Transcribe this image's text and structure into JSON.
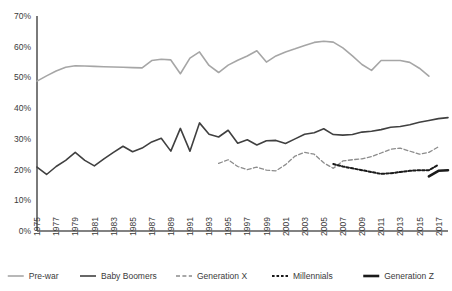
{
  "chart_data": {
    "type": "line",
    "title": "",
    "xlabel": "",
    "ylabel": "",
    "ylim": [
      0,
      70
    ],
    "yticks": [
      "0%",
      "10%",
      "20%",
      "30%",
      "40%",
      "50%",
      "60%",
      "70%"
    ],
    "ytick_values": [
      0,
      10,
      20,
      30,
      40,
      50,
      60,
      70
    ],
    "grid": false,
    "legend_position": "bottom",
    "x": [
      1975,
      1976,
      1977,
      1978,
      1979,
      1980,
      1981,
      1982,
      1983,
      1984,
      1985,
      1986,
      1987,
      1988,
      1989,
      1990,
      1991,
      1992,
      1993,
      1994,
      1995,
      1996,
      1997,
      1998,
      1999,
      2000,
      2001,
      2002,
      2003,
      2004,
      2005,
      2006,
      2007,
      2008,
      2009,
      2010,
      2011,
      2012,
      2013,
      2014,
      2015,
      2016,
      2017,
      2018
    ],
    "xticks": [
      "1975",
      "1977",
      "1979",
      "1981",
      "1983",
      "1985",
      "1987",
      "1989",
      "1991",
      "1993",
      "1995",
      "1997",
      "1999",
      "2001",
      "2003",
      "2005",
      "2007",
      "2009",
      "2011",
      "2013",
      "2015",
      "2017"
    ],
    "series": [
      {
        "name": "Pre-war",
        "color": "#a6a6a6",
        "style": "solid",
        "start_year": 1975,
        "values": [
          48.8,
          50.5,
          52.1,
          53.3,
          53.8,
          53.7,
          53.6,
          53.5,
          53.4,
          53.3,
          53.2,
          53.1,
          55.5,
          55.9,
          55.7,
          51.2,
          56.3,
          58.3,
          53.9,
          51.6,
          54.0,
          55.6,
          57.0,
          58.7,
          55.0,
          57.0,
          58.3,
          59.3,
          60.4,
          61.4,
          61.8,
          61.5,
          59.6,
          57.0,
          54.2,
          52.3,
          55.5,
          55.5,
          55.5,
          54.9,
          53.0,
          50.4,
          null,
          null
        ]
      },
      {
        "name": "Baby Boomers",
        "color": "#404040",
        "style": "solid",
        "start_year": 1975,
        "values": [
          20.8,
          18.4,
          21.0,
          23.0,
          25.6,
          23.0,
          21.2,
          23.5,
          25.6,
          27.6,
          25.8,
          27.0,
          29.0,
          30.2,
          26.0,
          33.4,
          26.0,
          35.2,
          31.5,
          30.6,
          32.8,
          28.6,
          29.7,
          28.0,
          29.4,
          29.5,
          28.5,
          30.0,
          31.5,
          32.0,
          33.3,
          31.4,
          31.2,
          31.4,
          32.2,
          32.5,
          33.0,
          33.8,
          34.0,
          34.6,
          35.4,
          36.0,
          36.6,
          36.9
        ]
      },
      {
        "name": "Generation X",
        "color": "#8c8c8c",
        "style": "dashed",
        "start_year": 1994,
        "values": [
          null,
          null,
          null,
          null,
          null,
          null,
          null,
          null,
          null,
          null,
          null,
          null,
          null,
          null,
          null,
          null,
          null,
          null,
          null,
          22.0,
          23.2,
          21.0,
          20.0,
          20.8,
          19.8,
          19.6,
          21.6,
          24.4,
          25.6,
          25.0,
          22.2,
          20.4,
          22.8,
          23.2,
          23.5,
          24.2,
          25.4,
          26.6,
          27.0,
          26.0,
          25.0,
          25.6,
          27.4,
          null
        ]
      },
      {
        "name": "Millennials",
        "color": "#1a1a1a",
        "style": "dotted",
        "start_year": 2006,
        "values": [
          null,
          null,
          null,
          null,
          null,
          null,
          null,
          null,
          null,
          null,
          null,
          null,
          null,
          null,
          null,
          null,
          null,
          null,
          null,
          null,
          null,
          null,
          null,
          null,
          null,
          null,
          null,
          null,
          null,
          null,
          null,
          21.8,
          21.0,
          20.4,
          19.8,
          19.2,
          18.6,
          18.8,
          19.2,
          19.6,
          19.8,
          19.8,
          21.6,
          null
        ]
      },
      {
        "name": "Generation Z",
        "color": "#1a1a1a",
        "style": "solid-thick",
        "start_year": 2016,
        "values": [
          null,
          null,
          null,
          null,
          null,
          null,
          null,
          null,
          null,
          null,
          null,
          null,
          null,
          null,
          null,
          null,
          null,
          null,
          null,
          null,
          null,
          null,
          null,
          null,
          null,
          null,
          null,
          null,
          null,
          null,
          null,
          null,
          null,
          null,
          null,
          null,
          null,
          null,
          null,
          null,
          null,
          17.8,
          19.6,
          19.8
        ]
      }
    ],
    "legend": [
      {
        "label": "Pre-war",
        "color": "#a6a6a6",
        "style": "solid"
      },
      {
        "label": "Baby Boomers",
        "color": "#404040",
        "style": "solid"
      },
      {
        "label": "Generation X",
        "color": "#8c8c8c",
        "style": "dashed"
      },
      {
        "label": "Millennials",
        "color": "#1a1a1a",
        "style": "dotted"
      },
      {
        "label": "Generation Z",
        "color": "#1a1a1a",
        "style": "solid-thick"
      }
    ]
  },
  "axis": {
    "axis_color": "#595959"
  }
}
